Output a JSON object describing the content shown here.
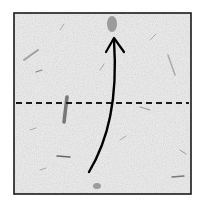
{
  "diagram": {
    "type": "origami-fold-step",
    "paper": {
      "shape": "square",
      "texture": "speckled-mulberry",
      "fill_color": "#e6e6e6",
      "border_color": "#1a1a1a",
      "x": 14,
      "y": 13,
      "width": 177,
      "height": 181
    },
    "fold_line": {
      "style": "dashed",
      "meaning": "valley-fold",
      "y": 103,
      "x1": 16,
      "x2": 189,
      "color": "#1a1a1a"
    },
    "fold_arrow": {
      "direction": "up",
      "meaning": "fold bottom edge up to top edge",
      "start": [
        89,
        172
      ],
      "end": [
        114,
        38
      ],
      "color": "#000000"
    }
  }
}
